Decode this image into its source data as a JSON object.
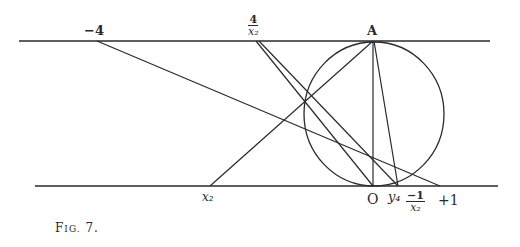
{
  "figure": {
    "caption_prefix": "F",
    "caption_rest": "IG.",
    "caption_number": "7."
  },
  "labels": {
    "top_minus4": "−4",
    "top_frac_num": "4",
    "top_frac_den": "x₂",
    "top_A": "A",
    "bottom_x2": "x₂",
    "bottom_O": "O",
    "bottom_y4": "y₄",
    "bottom_frac_num": "−1",
    "bottom_frac_den": "x₂",
    "bottom_plus1": "+1"
  },
  "geometry": {
    "stroke_color": "#2a2a2a",
    "top_line": {
      "x1": 19,
      "y1": 41,
      "x2": 490,
      "y2": 41
    },
    "bottom_line": {
      "x1": 35,
      "y1": 186,
      "x2": 498,
      "y2": 186
    },
    "circle": {
      "cx": 374,
      "cy": 114,
      "rx": 70,
      "ry": 72
    },
    "points": {
      "minus4": [
        97,
        41
      ],
      "four_over_x2": [
        256,
        41
      ],
      "A": [
        373,
        41
      ],
      "x2": [
        210,
        186
      ],
      "O": [
        373,
        186
      ],
      "y4": [
        398,
        186
      ],
      "minus1_over_x2": [
        408,
        186
      ],
      "plus1": [
        440,
        186
      ]
    },
    "segments": [
      [
        "minus4",
        "plus1"
      ],
      [
        "four_over_x2",
        "O"
      ],
      [
        "four_over_x2",
        "y4"
      ],
      [
        "x2",
        "A"
      ],
      [
        "A",
        "O"
      ],
      [
        "A",
        "y4"
      ]
    ]
  }
}
